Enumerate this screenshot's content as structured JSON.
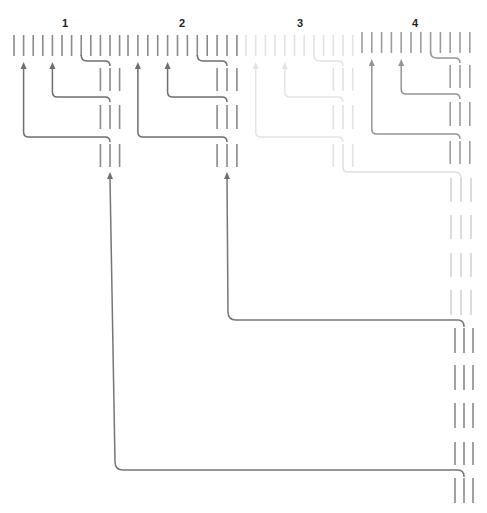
{
  "diagram": {
    "top_row": {
      "y1": 35,
      "y2": 56
    },
    "layout": {
      "line_count": 12,
      "hook_from": 7,
      "merge_to": 10,
      "triple_indices": [
        9,
        10,
        11
      ],
      "hook_y": 61,
      "triples": [
        [
          68,
          91
        ],
        [
          105,
          129
        ],
        [
          144,
          167
        ]
      ],
      "connectors": [
        {
          "from": 4,
          "y": 97
        },
        {
          "from": 1,
          "y": 137
        }
      ],
      "arrow_tip_y": 62,
      "feed_arrow_tip_y": 172
    },
    "groups": [
      {
        "label": "1",
        "x0": 14,
        "dx": 9.6,
        "dy": 0,
        "line_color": "#8a8a8a",
        "link_color": "#6e6e6e",
        "feed_from_below": true
      },
      {
        "label": "2",
        "x0": 128,
        "dx": 9.9,
        "dy": 0,
        "line_color": "#8a8a8a",
        "link_color": "#6e6e6e",
        "feed_from_below": true
      },
      {
        "label": "3",
        "x0": 246,
        "dx": 9.7,
        "dy": 0,
        "line_color": "#e2e2e2",
        "link_color": "#e4e4e4",
        "feed_from_below": false
      },
      {
        "label": "4",
        "x0": 362,
        "dx": 9.8,
        "dy": -3,
        "line_color": "#9c9c9c",
        "link_color": "#949494",
        "feed_from_below": false
      }
    ],
    "long_connectors": [
      {
        "from_group": "1",
        "x_start": 110,
        "y_start": 179,
        "x_bend": 115,
        "y_turn": 470,
        "x_end": 464,
        "r": 8,
        "color": "#767676"
      },
      {
        "from_group": "2",
        "x_start": 227,
        "y_start": 179,
        "x_bend": 228,
        "y_turn": 320,
        "x_end": 464,
        "r": 8,
        "color": "#767676"
      },
      {
        "from_group": "3",
        "x_start": 343,
        "y_start": 166,
        "x_bend": 343,
        "y_turn": 172,
        "x_end": 461,
        "r": 5,
        "color": "#e0e0e0"
      }
    ],
    "right_column": {
      "faint": {
        "x": [
          451,
          461,
          471
        ],
        "color": "#d4d4d4",
        "ranges": [
          [
            178,
            202
          ],
          [
            215,
            239
          ],
          [
            253,
            277
          ],
          [
            290,
            315
          ]
        ]
      },
      "dark": {
        "x": [
          455,
          464,
          473
        ],
        "color": "#8a8a8a",
        "ranges": [
          [
            328,
            353
          ],
          [
            365,
            390
          ],
          [
            403,
            428
          ],
          [
            442,
            465
          ],
          [
            478,
            503
          ]
        ]
      }
    }
  }
}
